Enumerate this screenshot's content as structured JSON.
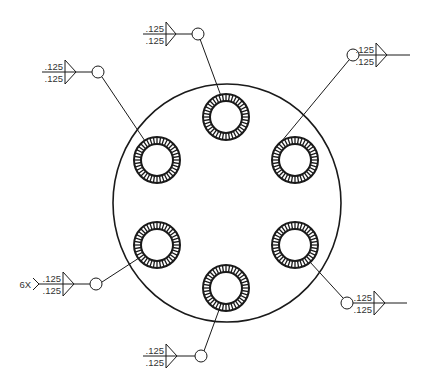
{
  "drawing": {
    "title": "Bolt circle plate with six welded holes",
    "plate": {
      "cx": 227,
      "cy": 203,
      "r": 116
    },
    "hole": {
      "outer_r": 23,
      "inner_r": 16,
      "hatch_count": 40
    },
    "holes": [
      {
        "id": "top",
        "cx": 226,
        "cy": 117
      },
      {
        "id": "upper-left",
        "cx": 157,
        "cy": 160
      },
      {
        "id": "upper-right",
        "cx": 295,
        "cy": 160
      },
      {
        "id": "lower-left",
        "cx": 157,
        "cy": 245
      },
      {
        "id": "lower-right",
        "cx": 295,
        "cy": 245
      },
      {
        "id": "bottom",
        "cx": 226,
        "cy": 288
      }
    ],
    "weld_symbols": [
      {
        "id": "top",
        "top_size": ".125",
        "bottom_size": ".125",
        "tail_note": ""
      },
      {
        "id": "upper-left",
        "top_size": ".125",
        "bottom_size": ".125",
        "tail_note": ""
      },
      {
        "id": "upper-right",
        "top_size": ".125",
        "bottom_size": ".125",
        "tail_note": ""
      },
      {
        "id": "lower-left",
        "top_size": ".125",
        "bottom_size": ".125",
        "tail_note": "6X"
      },
      {
        "id": "lower-right",
        "top_size": ".125",
        "bottom_size": ".125",
        "tail_note": ""
      },
      {
        "id": "bottom",
        "top_size": ".125",
        "bottom_size": ".125",
        "tail_note": ""
      }
    ],
    "colors": {
      "line": "#1a1a1a",
      "background": "#ffffff"
    }
  }
}
